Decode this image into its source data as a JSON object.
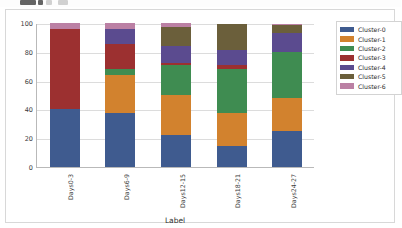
{
  "toolbar": {
    "buttons": [
      "tool-1",
      "tool-2",
      "tool-3",
      "tool-4"
    ]
  },
  "chart_data": {
    "type": "bar",
    "stacked": true,
    "title": "",
    "xlabel": "Label",
    "ylabel": "",
    "ylim": [
      0,
      100
    ],
    "yticks": [
      0,
      20,
      40,
      60,
      80,
      100
    ],
    "ytick_labels": [
      "0",
      "20",
      "40",
      "60",
      "80",
      "100"
    ],
    "grid": true,
    "legend_position": "right",
    "categories": [
      "Days0-3",
      "Days6-9",
      "Days12-15",
      "Days18-21",
      "Days24-27"
    ],
    "series": [
      {
        "name": "Cluster-0",
        "color": "#3f5b8f",
        "values": [
          40.0,
          37.5,
          22.0,
          14.7,
          25.2
        ]
      },
      {
        "name": "Cluster-1",
        "color": "#d2822e",
        "values": [
          0.0,
          26.3,
          28.0,
          22.8,
          22.4
        ]
      },
      {
        "name": "Cluster-2",
        "color": "#3f8c51",
        "values": [
          0.0,
          4.2,
          20.5,
          30.5,
          32.0
        ]
      },
      {
        "name": "Cluster-3",
        "color": "#9c3030",
        "values": [
          55.7,
          17.2,
          1.5,
          2.8,
          0.0
        ]
      },
      {
        "name": "Cluster-4",
        "color": "#5b4b8f",
        "values": [
          0.0,
          10.8,
          12.0,
          10.2,
          13.4
        ]
      },
      {
        "name": "Cluster-5",
        "color": "#6b5f3b",
        "values": [
          0.0,
          0.0,
          13.0,
          18.0,
          5.8
        ]
      },
      {
        "name": "Cluster-6",
        "color": "#bb80a4",
        "values": [
          4.3,
          4.0,
          3.0,
          0.0,
          0.8
        ]
      }
    ]
  }
}
